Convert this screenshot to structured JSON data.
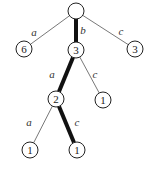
{
  "diagram": {
    "type": "trie",
    "nodes": [
      {
        "id": "root",
        "label": "",
        "x": 76,
        "y": 11
      },
      {
        "id": "n_a",
        "label": "6",
        "x": 24,
        "y": 49
      },
      {
        "id": "n_b",
        "label": "3",
        "x": 76,
        "y": 50
      },
      {
        "id": "n_c",
        "label": "3",
        "x": 135,
        "y": 49
      },
      {
        "id": "n_ba",
        "label": "2",
        "x": 56,
        "y": 99
      },
      {
        "id": "n_bc",
        "label": "1",
        "x": 103,
        "y": 100
      },
      {
        "id": "n_baa",
        "label": "1",
        "x": 30,
        "y": 150
      },
      {
        "id": "n_bac",
        "label": "1",
        "x": 77,
        "y": 150
      }
    ],
    "edges": [
      {
        "from": "root",
        "to": "n_a",
        "label": "a",
        "bold": false,
        "lx": 34,
        "ly": 36
      },
      {
        "from": "root",
        "to": "n_b",
        "label": "b",
        "bold": true,
        "lx": 83,
        "ly": 34
      },
      {
        "from": "root",
        "to": "n_c",
        "label": "c",
        "bold": false,
        "lx": 121,
        "ly": 35
      },
      {
        "from": "n_b",
        "to": "n_ba",
        "label": "a",
        "bold": true,
        "lx": 52,
        "ly": 78
      },
      {
        "from": "n_b",
        "to": "n_bc",
        "label": "c",
        "bold": false,
        "lx": 95,
        "ly": 78
      },
      {
        "from": "n_ba",
        "to": "n_baa",
        "label": "a",
        "bold": false,
        "lx": 29,
        "ly": 126
      },
      {
        "from": "n_ba",
        "to": "n_bac",
        "label": "c",
        "bold": true,
        "lx": 77,
        "ly": 126
      }
    ]
  }
}
